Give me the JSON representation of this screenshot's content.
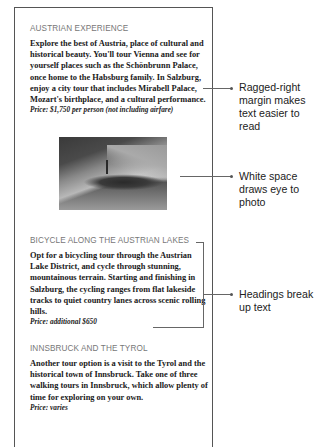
{
  "document": {
    "sections": [
      {
        "heading": "AUSTRIAN EXPERIENCE",
        "body": "Explore the best of Austria, place of cultural and historical beauty. You'll tour Vienna and see for yourself places such as the Schönbrunn Palace, once home to the Habsburg family. In Salzburg, enjoy a city tour that includes Mirabell Palace, Mozart's birthplace, and a cultural performance.",
        "price": "Price: $1,750 per person (not including airfare)"
      },
      {
        "heading": "BICYCLE ALONG THE AUSTRIAN LAKES",
        "body": "Opt for a bicycling tour through the Austrian Lake District, and cycle through stunning, mountainous terrain. Starting and finishing in Salzburg, the cycling ranges from flat lakeside tracks to quiet country lanes across scenic rolling hills.",
        "price": "Price: additional $650"
      },
      {
        "heading": "INNSBRUCK AND THE TYROL",
        "body": "Another tour option is a visit to the Tyrol and the historical town of Innsbruck. Take one of three walking tours in Innsbruck, which allow plenty of time for exploring on your own.",
        "price": "Price: varies"
      }
    ],
    "photo": {
      "description": "lakeside village with church spire beneath mountains"
    }
  },
  "callouts": [
    {
      "label": "Ragged-right margin makes text easier to read"
    },
    {
      "label": "White space draws eye to photo"
    },
    {
      "label": "Headings break up text"
    }
  ]
}
